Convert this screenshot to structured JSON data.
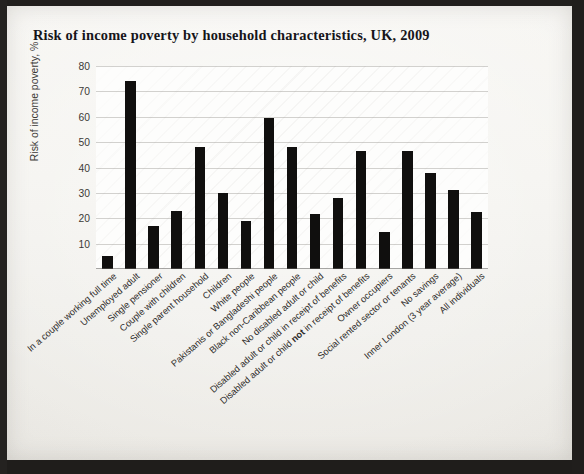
{
  "page": {
    "title": "Risk of income poverty by household characteristics, UK, 2009"
  },
  "chart_data": {
    "type": "bar",
    "title": "Risk of income poverty by household characteristics, UK, 2009",
    "xlabel": "",
    "ylabel": "Risk of income poverty, %",
    "ylim": [
      0,
      80
    ],
    "yticks": [
      80,
      70,
      60,
      50,
      40,
      30,
      20,
      10
    ],
    "grid": true,
    "legend": "none",
    "bar_color": "#100f0e",
    "categories": [
      "In a couple working full time",
      "Unemployed adult",
      "Single pensioner",
      "Couple with children",
      "Single parent household",
      "Children",
      "White people",
      "Pakistanis or Bangladeshi people",
      "Black non-Caribbean people",
      "No disabled adult or child",
      "Disabled adult or child in receipt of benefits",
      "Disabled adult or child not in receipt of benefits",
      "Owner occupiers",
      "Social rented sector or tenants",
      "No savings",
      "Inner London (3 year average)",
      "All individuals"
    ],
    "categories_markup": [
      "In a couple working full time",
      "Unemployed adult",
      "Single pensioner",
      "Couple with children",
      "Single parent household",
      "Children",
      "White people",
      "Pakistanis or Bangladeshi people",
      "Black non-Caribbean people",
      "No disabled adult or child",
      "Disabled adult or child in receipt of benefits",
      "Disabled adult or child <b>not</b> in receipt of benefits",
      "Owner occupiers",
      "Social rented sector or tenants",
      "No savings",
      "Inner London (3 year average)",
      "All individuals"
    ],
    "values": [
      5,
      74,
      17,
      23,
      48,
      30,
      19,
      59.5,
      48,
      21.5,
      28,
      46.5,
      14.5,
      46.5,
      38,
      31,
      22.5
    ]
  }
}
